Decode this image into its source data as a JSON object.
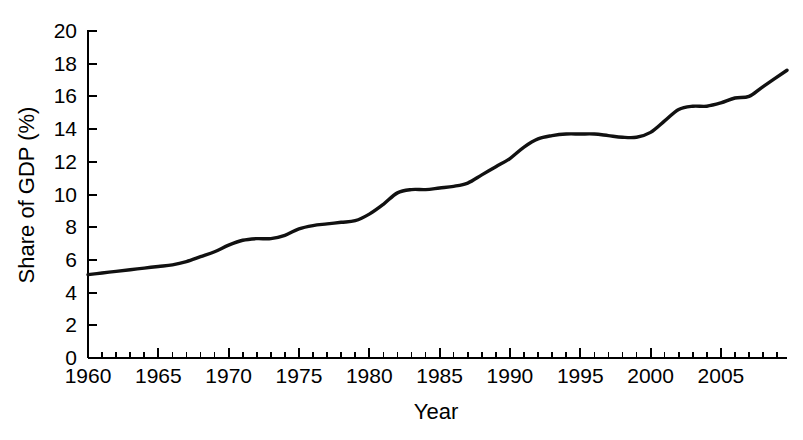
{
  "chart_data": {
    "type": "line",
    "title": "",
    "xlabel": "Year",
    "ylabel": "Share of GDP (%)",
    "xlim": [
      1960,
      2009.7
    ],
    "ylim": [
      0,
      20
    ],
    "grid": false,
    "legend": null,
    "x_ticks_major": [
      1960,
      1965,
      1970,
      1975,
      1980,
      1985,
      1990,
      1995,
      2000,
      2005
    ],
    "x_tick_labels": [
      "1960",
      "1965",
      "1970",
      "1975",
      "1980",
      "1985",
      "1990",
      "1995",
      "2000",
      "2005"
    ],
    "x_tick_minor_step": 1,
    "y_ticks": [
      0,
      2,
      4,
      6,
      8,
      10,
      12,
      14,
      16,
      18,
      20
    ],
    "y_tick_labels": [
      "0",
      "2",
      "4",
      "6",
      "8",
      "10",
      "12",
      "14",
      "16",
      "18",
      "20"
    ],
    "line_color": "#111111",
    "series": [
      {
        "name": "Health care spending share of GDP",
        "x": [
          1960,
          1961,
          1962,
          1963,
          1964,
          1965,
          1966,
          1967,
          1968,
          1969,
          1970,
          1971,
          1972,
          1973,
          1974,
          1975,
          1976,
          1977,
          1978,
          1979,
          1980,
          1981,
          1982,
          1983,
          1984,
          1985,
          1986,
          1987,
          1988,
          1989,
          1990,
          1991,
          1992,
          1993,
          1994,
          1995,
          1996,
          1997,
          1998,
          1999,
          2000,
          2001,
          2002,
          2003,
          2004,
          2005,
          2006,
          2007,
          2008,
          2009.7
        ],
        "values": [
          5.1,
          5.2,
          5.3,
          5.4,
          5.5,
          5.6,
          5.7,
          5.9,
          6.2,
          6.5,
          6.9,
          7.2,
          7.3,
          7.3,
          7.5,
          7.9,
          8.1,
          8.2,
          8.3,
          8.4,
          8.8,
          9.4,
          10.1,
          10.3,
          10.3,
          10.4,
          10.5,
          10.7,
          11.2,
          11.7,
          12.2,
          12.9,
          13.4,
          13.6,
          13.7,
          13.7,
          13.7,
          13.6,
          13.5,
          13.5,
          13.8,
          14.5,
          15.2,
          15.4,
          15.4,
          15.6,
          15.9,
          16.0,
          16.6,
          17.6
        ]
      }
    ]
  },
  "axes": {
    "y_axis_title": "Share of GDP (%)",
    "x_axis_title": "Year"
  }
}
